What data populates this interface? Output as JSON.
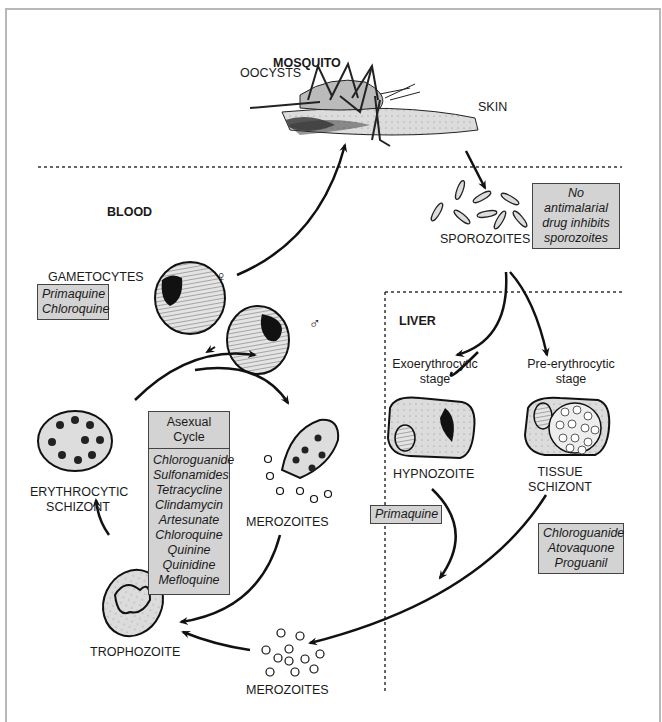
{
  "regions": {
    "mosquito": "MOSQUITO",
    "blood": "BLOOD",
    "liver": "LIVER"
  },
  "labels": {
    "oocysts": "OOCYSTS",
    "skin": "SKIN",
    "sporozoites": "SPOROZOITES",
    "gametocytes": "GAMETOCYTES",
    "female_symbol": "♀",
    "male_symbol": "♂",
    "erythrocytic_schizont": [
      "ERYTHROCYTIC",
      "SCHIZONT"
    ],
    "merozoites_blood": "MEROZOITES",
    "trophozoite": "TROPHOZOITE",
    "merozoites_liver": "MEROZOITES",
    "exoerythrocytic_stage": [
      "Exoerythrocytic",
      "stage"
    ],
    "preerythrocytic_stage": [
      "Pre-erythrocytic",
      "stage"
    ],
    "hypnozoite": "HYPNOZOITE",
    "tissue_schizont": [
      "TISSUE",
      "SCHIZONT"
    ]
  },
  "drug_boxes": {
    "sporozoites": [
      "No antimalarial",
      "drug inhibits",
      "sporozoites"
    ],
    "gametocytes": [
      "Primaquine",
      "Chloroquine"
    ],
    "asexual_cycle": {
      "title": "Asexual Cycle",
      "drugs": [
        "Chloroguanide",
        "Sulfonamides",
        "Tetracycline",
        "Clindamycin",
        "Artesunate",
        "Chloroquine",
        "Quinine",
        "Quinidine",
        "Mefloquine"
      ]
    },
    "hypnozoite": [
      "Primaquine"
    ],
    "tissue_schizont": [
      "Chloroguanide",
      "Atovaquone",
      "Proguanil"
    ]
  },
  "colors": {
    "box_fill": "#d3d3d3",
    "cell_fill": "#dcdcdc",
    "ink": "#1a1a1a"
  }
}
